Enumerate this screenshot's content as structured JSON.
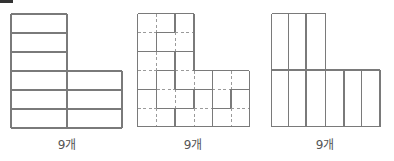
{
  "figures": [
    {
      "id": "figure-1",
      "label": "9개",
      "label_x": 67,
      "description": "L-shape divided into 9 horizontal rectangles",
      "solid": [
        [
          11,
          14,
          67,
          14
        ],
        [
          11,
          14,
          11,
          128
        ],
        [
          67,
          14,
          67,
          128
        ],
        [
          11,
          33,
          67,
          33
        ],
        [
          11,
          52,
          67,
          52
        ],
        [
          11,
          71,
          122,
          71
        ],
        [
          11,
          90,
          122,
          90
        ],
        [
          11,
          109,
          122,
          109
        ],
        [
          11,
          128,
          122,
          128
        ],
        [
          122,
          71,
          122,
          128
        ]
      ],
      "dashed": []
    },
    {
      "id": "figure-2",
      "label": "9개",
      "label_x": 193,
      "description": "L-shape on dashed 6x6 grid divided into 9 L/square pieces",
      "solid": [
        [
          137.7,
          13.5,
          194,
          13.5
        ],
        [
          137.7,
          13.5,
          137.7,
          126.7
        ],
        [
          194,
          13.5,
          194,
          70.7
        ],
        [
          194,
          70.7,
          249.3,
          70.7
        ],
        [
          249.3,
          70.7,
          249.3,
          126.7
        ],
        [
          137.7,
          126.7,
          249.3,
          126.7
        ],
        [
          175,
          13.5,
          175,
          32.3
        ],
        [
          156.7,
          32.3,
          175,
          32.3
        ],
        [
          156.7,
          32.3,
          156.7,
          51.7
        ],
        [
          137.7,
          51.7,
          194,
          51.7
        ],
        [
          175,
          51.7,
          175,
          70.7
        ],
        [
          156.7,
          70.7,
          175,
          70.7
        ],
        [
          194,
          70.7,
          212.3,
          70.7
        ],
        [
          156.7,
          70.7,
          156.7,
          108.3
        ],
        [
          175,
          70.7,
          175,
          89.3
        ],
        [
          212.3,
          70.7,
          212.3,
          126.7
        ],
        [
          137.7,
          89.3,
          156.7,
          89.3
        ],
        [
          175,
          89.3,
          212.3,
          89.3
        ],
        [
          231,
          89.3,
          249.3,
          89.3
        ],
        [
          194,
          89.3,
          194,
          108.3
        ],
        [
          231,
          89.3,
          231,
          108.3
        ],
        [
          156.7,
          108.3,
          194,
          108.3
        ],
        [
          212.3,
          108.3,
          231,
          108.3
        ],
        [
          175,
          108.3,
          175,
          126.7
        ]
      ],
      "dashed": [
        [
          156.7,
          13.5,
          156.7,
          32.3
        ],
        [
          137.7,
          32.3,
          156.7,
          32.3
        ],
        [
          175,
          32.3,
          194,
          32.3
        ],
        [
          175,
          32.3,
          175,
          51.7
        ],
        [
          156.7,
          51.7,
          156.7,
          70.7
        ],
        [
          137.7,
          70.7,
          156.7,
          70.7
        ],
        [
          175,
          70.7,
          194,
          70.7
        ],
        [
          194,
          70.7,
          194,
          89.3
        ],
        [
          231,
          70.7,
          231,
          89.3
        ],
        [
          156.7,
          89.3,
          175,
          89.3
        ],
        [
          212.3,
          89.3,
          231,
          89.3
        ],
        [
          175,
          89.3,
          175,
          108.3
        ],
        [
          137.7,
          108.3,
          156.7,
          108.3
        ],
        [
          194,
          108.3,
          212.3,
          108.3
        ],
        [
          231,
          108.3,
          249.3,
          108.3
        ],
        [
          156.7,
          108.3,
          156.7,
          126.7
        ],
        [
          194,
          108.3,
          194,
          126.7
        ],
        [
          231,
          108.3,
          231,
          126.7
        ]
      ]
    },
    {
      "id": "figure-3",
      "label": "9개",
      "label_x": 325,
      "description": "L-shape divided into 9 vertical rectangles",
      "solid": [
        [
          271.7,
          13.5,
          325.7,
          13.5
        ],
        [
          271.7,
          13.5,
          271.7,
          126.7
        ],
        [
          325.7,
          13.5,
          325.7,
          126.7
        ],
        [
          288.3,
          13.5,
          288.3,
          126.7
        ],
        [
          306,
          13.5,
          306,
          126.7
        ],
        [
          271.7,
          70,
          380,
          70
        ],
        [
          380,
          70,
          380,
          126.7
        ],
        [
          271.7,
          126.7,
          380,
          126.7
        ],
        [
          344,
          70,
          344,
          126.7
        ],
        [
          361.7,
          70,
          361.7,
          126.7
        ]
      ],
      "dashed": []
    }
  ]
}
